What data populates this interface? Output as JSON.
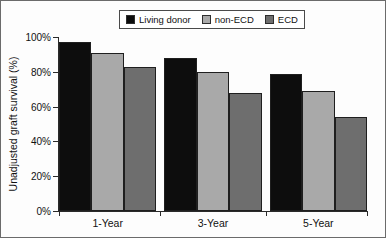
{
  "chart_data": {
    "type": "bar",
    "title": "",
    "xlabel": "",
    "ylabel": "Unadjusted graft survival (%)",
    "categories": [
      "1-Year",
      "3-Year",
      "5-Year"
    ],
    "series": [
      {
        "name": "Living donor",
        "color": "#0d0d0d",
        "values": [
          97,
          88,
          79
        ]
      },
      {
        "name": "non-ECD",
        "color": "#a9a9a9",
        "values": [
          91,
          80,
          69
        ]
      },
      {
        "name": "ECD",
        "color": "#6e6e6e",
        "values": [
          83,
          68,
          54
        ]
      }
    ],
    "ylim": [
      0,
      100
    ],
    "ytick_values": [
      0,
      20,
      40,
      60,
      80,
      100
    ],
    "ytick_labels": [
      "0%",
      "20%",
      "40%",
      "60%",
      "80%",
      "100%"
    ],
    "grid": false,
    "legend_position": "top-center",
    "value_suffix": "%"
  },
  "legend": {
    "entries": [
      {
        "label": "Living donor",
        "color": "#0d0d0d"
      },
      {
        "label": "non-ECD",
        "color": "#a9a9a9"
      },
      {
        "label": "ECD",
        "color": "#6e6e6e"
      }
    ]
  },
  "axes": {
    "y_title": "Unadjusted graft survival (%)",
    "y_ticks": [
      "0%",
      "20%",
      "40%",
      "60%",
      "80%",
      "100%"
    ],
    "x_categories": [
      "1-Year",
      "3-Year",
      "5-Year"
    ]
  }
}
